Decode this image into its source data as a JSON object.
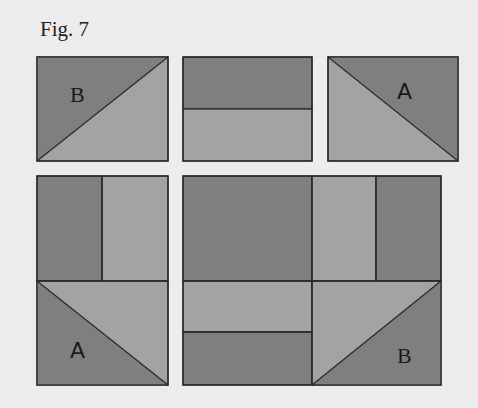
{
  "figure": {
    "title": "Fig. 7",
    "colors": {
      "background": "#ececec",
      "dark": "#7f7f7f",
      "light": "#a3a3a3",
      "line": "#2a2a2a"
    },
    "top_row": [
      {
        "name": "half-square-triangle-B",
        "label": "B",
        "diagonal": "bottom-left to top-right",
        "dark_region": "upper-left triangle"
      },
      {
        "name": "two-strip-rectangle",
        "label": "",
        "split": "horizontal",
        "dark_region": "top strip"
      },
      {
        "name": "half-square-triangle-A",
        "label": "A",
        "diagonal": "top-left to bottom-right",
        "dark_region": "upper-right triangle"
      }
    ],
    "bottom_row": {
      "left_block": {
        "upper": {
          "split": "vertical",
          "left": "dark",
          "right": "light"
        },
        "lower": {
          "label": "A",
          "diagonal": "top-left to bottom-right",
          "dark_region": "lower-left triangle"
        }
      },
      "right_block": {
        "upper_left": "dark square",
        "upper_right": {
          "split": "vertical",
          "left": "light",
          "right": "dark"
        },
        "lower_left": {
          "split": "horizontal",
          "top": "light",
          "bottom": "dark"
        },
        "lower_right": {
          "label": "B",
          "diagonal": "bottom-left to top-right",
          "dark_region": "lower-right triangle"
        }
      }
    },
    "labels": {
      "top_left": "B",
      "top_right": "A",
      "bottom_left": "A",
      "bottom_right": "B"
    }
  }
}
